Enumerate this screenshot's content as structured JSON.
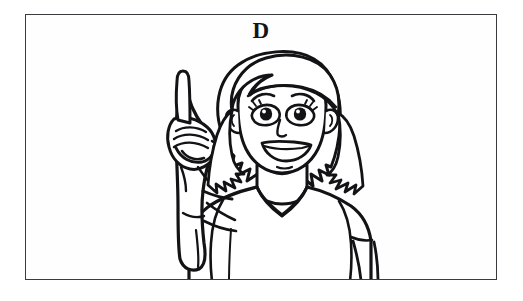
{
  "page": {
    "background_color": "#ffffff",
    "width": 523,
    "height": 301
  },
  "illustration": {
    "label": "D",
    "label_color": "#141417",
    "frame": {
      "border_color": "#3a3a3f",
      "background_color": "#fefefe",
      "left": 25,
      "top": 14,
      "width": 472,
      "height": 266
    },
    "alt_text": "Line drawing of a smiling young woman with a short bob haircut raising her right hand to sign the American Sign Language letter D",
    "ink_color": "#131316",
    "subject": {
      "name": "woman-signing-letter-d",
      "hand_shape": "index finger extended upward, remaining fingers touching thumb to form a circle",
      "expression": "smiling",
      "hair_style": "short bob with side-swept bangs",
      "clothing": "short-sleeve v-neck t-shirt"
    }
  }
}
